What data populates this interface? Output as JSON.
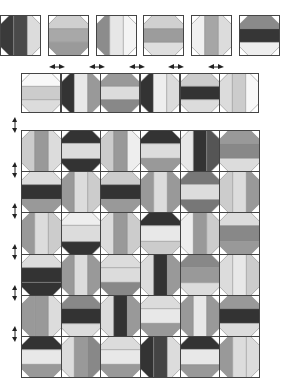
{
  "diagram": {
    "title": "",
    "colors": {
      "background": "#ffffff",
      "outline": "#444444",
      "seam": "#888888",
      "corner": "#ffffff",
      "arrow": "#222222"
    },
    "single_blocks": {
      "x": [
        0,
        48,
        96,
        143,
        191,
        239
      ],
      "y": 15,
      "size": 41,
      "blocks": [
        {
          "o": "v",
          "c": [
            "#3a3a3a",
            "#4a4a4a",
            "#dcdcdc"
          ]
        },
        {
          "o": "h",
          "c": [
            "#cfcfcf",
            "#a8a8a8",
            "#9a9a9a"
          ]
        },
        {
          "o": "v",
          "c": [
            "#8c8c8c",
            "#e6e6e6",
            "#f4f4f4"
          ]
        },
        {
          "o": "h",
          "c": [
            "#d0d0d0",
            "#9c9c9c",
            "#dedede"
          ]
        },
        {
          "o": "v",
          "c": [
            "#f0f0f0",
            "#a6a6a6",
            "#dcdcdc"
          ]
        },
        {
          "o": "h",
          "c": [
            "#8a8a8a",
            "#363636",
            "#eeeeee"
          ]
        }
      ]
    },
    "strip": {
      "x": 21,
      "y": 73,
      "width": 238,
      "height": 40,
      "blocks": [
        {
          "o": "h",
          "c": [
            "#f8f8f8",
            "#cccccc",
            "#dcdcdc"
          ]
        },
        {
          "o": "v",
          "c": [
            "#333333",
            "#e8e8e8",
            "#999999"
          ]
        },
        {
          "o": "h",
          "c": [
            "#999999",
            "#dcdcdc",
            "#888888"
          ]
        },
        {
          "o": "v",
          "c": [
            "#333333",
            "#eeeeee",
            "#dcdcdc"
          ]
        },
        {
          "o": "h",
          "c": [
            "#cccccc",
            "#333333",
            "#dcdcdc"
          ]
        },
        {
          "o": "v",
          "c": [
            "#dcdcdc",
            "#cccccc",
            "#f8f8f8"
          ]
        }
      ]
    },
    "grid": {
      "x": 21,
      "y": 130,
      "width": 238,
      "height": 247,
      "rows": 6,
      "cols": 6,
      "blocks": [
        [
          {
            "o": "v",
            "c": [
              "#cccccc",
              "#999999",
              "#dcdcdc"
            ]
          },
          {
            "o": "h",
            "c": [
              "#333333",
              "#dcdcdc",
              "#333333"
            ]
          },
          {
            "o": "v",
            "c": [
              "#cccccc",
              "#999999",
              "#eeeeee"
            ]
          },
          {
            "o": "h",
            "c": [
              "#333333",
              "#dcdcdc",
              "#999999"
            ]
          },
          {
            "o": "v",
            "c": [
              "#e8e8e8",
              "#333333",
              "#555555"
            ]
          },
          {
            "o": "h",
            "c": [
              "#999999",
              "#888888",
              "#dcdcdc"
            ]
          }
        ],
        [
          {
            "o": "h",
            "c": [
              "#dcdcdc",
              "#333333",
              "#999999"
            ]
          },
          {
            "o": "v",
            "c": [
              "#999999",
              "#dcdcdc",
              "#cccccc"
            ]
          },
          {
            "o": "h",
            "c": [
              "#cccccc",
              "#333333",
              "#999999"
            ]
          },
          {
            "o": "v",
            "c": [
              "#999999",
              "#dcdcdc",
              "#999999"
            ]
          },
          {
            "o": "h",
            "c": [
              "#777777",
              "#dcdcdc",
              "#777777"
            ]
          },
          {
            "o": "v",
            "c": [
              "#cccccc",
              "#dcdcdc",
              "#999999"
            ]
          }
        ],
        [
          {
            "o": "v",
            "c": [
              "#999999",
              "#dcdcdc",
              "#cccccc"
            ]
          },
          {
            "o": "h",
            "c": [
              "#eeeeee",
              "#dcdcdc",
              "#333333"
            ]
          },
          {
            "o": "v",
            "c": [
              "#dcdcdc",
              "#999999",
              "#cccccc"
            ]
          },
          {
            "o": "h",
            "c": [
              "#333333",
              "#e8e8e8",
              "#cccccc"
            ]
          },
          {
            "o": "v",
            "c": [
              "#eeeeee",
              "#999999",
              "#cccccc"
            ]
          },
          {
            "o": "h",
            "c": [
              "#dcdcdc",
              "#888888",
              "#999999"
            ]
          }
        ],
        [
          {
            "o": "h",
            "c": [
              "#dcdcdc",
              "#333333",
              "#333333"
            ]
          },
          {
            "o": "v",
            "c": [
              "#999999",
              "#dcdcdc",
              "#999999"
            ]
          },
          {
            "o": "h",
            "c": [
              "#dcdcdc",
              "#dcdcdc",
              "#888888"
            ]
          },
          {
            "o": "v",
            "c": [
              "#dcdcdc",
              "#333333",
              "#999999"
            ]
          },
          {
            "o": "h",
            "c": [
              "#888888",
              "#999999",
              "#dcdcdc"
            ]
          },
          {
            "o": "v",
            "c": [
              "#dcdcdc",
              "#e8e8e8",
              "#cccccc"
            ]
          }
        ],
        [
          {
            "o": "v",
            "c": [
              "#999999",
              "#999999",
              "#dcdcdc"
            ]
          },
          {
            "o": "h",
            "c": [
              "#888888",
              "#333333",
              "#dcdcdc"
            ]
          },
          {
            "o": "v",
            "c": [
              "#dcdcdc",
              "#333333",
              "#999999"
            ]
          },
          {
            "o": "h",
            "c": [
              "#dcdcdc",
              "#e8e8e8",
              "#999999"
            ]
          },
          {
            "o": "v",
            "c": [
              "#999999",
              "#e8e8e8",
              "#999999"
            ]
          },
          {
            "o": "h",
            "c": [
              "#999999",
              "#333333",
              "#dcdcdc"
            ]
          }
        ],
        [
          {
            "o": "h",
            "c": [
              "#333333",
              "#e8e8e8",
              "#999999"
            ]
          },
          {
            "o": "v",
            "c": [
              "#dcdcdc",
              "#999999",
              "#888888"
            ]
          },
          {
            "o": "h",
            "c": [
              "#dcdcdc",
              "#e8e8e8",
              "#999999"
            ]
          },
          {
            "o": "v",
            "c": [
              "#333333",
              "#444444",
              "#dcdcdc"
            ]
          },
          {
            "o": "h",
            "c": [
              "#333333",
              "#e8e8e8",
              "#999999"
            ]
          },
          {
            "o": "v",
            "c": [
              "#999999",
              "#dcdcdc",
              "#dcdcdc"
            ]
          }
        ]
      ]
    },
    "arrows": {
      "horizontal": [
        {
          "x": 49,
          "y": 63
        },
        {
          "x": 89,
          "y": 63
        },
        {
          "x": 129,
          "y": 63
        },
        {
          "x": 168,
          "y": 63
        },
        {
          "x": 208,
          "y": 63
        }
      ],
      "vertical": [
        {
          "x": 12,
          "y": 117
        },
        {
          "x": 12,
          "y": 162
        },
        {
          "x": 12,
          "y": 203
        },
        {
          "x": 12,
          "y": 244
        },
        {
          "x": 12,
          "y": 285
        },
        {
          "x": 12,
          "y": 326
        }
      ]
    }
  }
}
